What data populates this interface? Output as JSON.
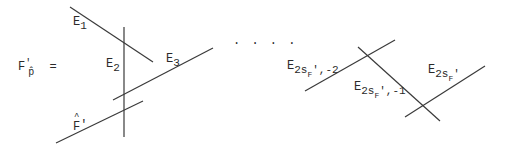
{
  "diagram": {
    "lhs": {
      "main": "F",
      "sup": "'",
      "sub": "p̂",
      "equals": "="
    },
    "ellipsis": ". . . .",
    "line_color": "#3a3a3a",
    "lines": [
      {
        "id": "E1",
        "x1": 70,
        "y1": 7,
        "x2": 153,
        "y2": 62
      },
      {
        "id": "E2",
        "x1": 124,
        "y1": 27,
        "x2": 124,
        "y2": 137
      },
      {
        "id": "E3",
        "x1": 113,
        "y1": 100,
        "x2": 213,
        "y2": 48
      },
      {
        "id": "F-hat-prime",
        "x1": 56,
        "y1": 143,
        "x2": 143,
        "y2": 101
      },
      {
        "id": "E2sF-2",
        "x1": 305,
        "y1": 91,
        "x2": 395,
        "y2": 40
      },
      {
        "id": "E2sF-1",
        "x1": 358,
        "y1": 47,
        "x2": 440,
        "y2": 121
      },
      {
        "id": "E2sF",
        "x1": 405,
        "y1": 117,
        "x2": 485,
        "y2": 66
      }
    ],
    "labels": {
      "e1": {
        "main": "E",
        "sub": "1"
      },
      "e2": {
        "main": "E",
        "sub": "2"
      },
      "e3": {
        "main": "E",
        "sub": "3"
      },
      "fhat": {
        "main": "F",
        "sup": "'"
      },
      "e2sf_m2": {
        "main": "E",
        "sub": "2s",
        "subsub": "F",
        "tail": "',-2"
      },
      "e2sf_m1": {
        "main": "E",
        "sub": "2s",
        "subsub": "F",
        "tail": "',-1"
      },
      "e2sf": {
        "main": "E",
        "sub": "2s",
        "subsub": "F",
        "tail": "'"
      }
    }
  }
}
